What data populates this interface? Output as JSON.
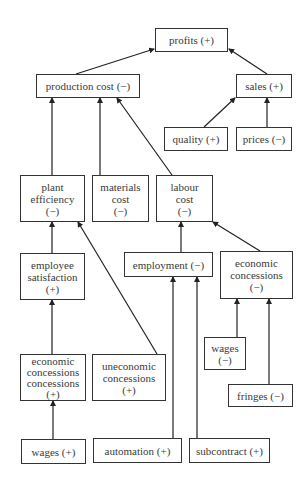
{
  "diagram": {
    "type": "causal-tree",
    "line_color": "#222222",
    "nodes": {
      "profits": {
        "lines": [
          "profits (+)"
        ]
      },
      "production_cost": {
        "lines": [
          "production cost (−)"
        ]
      },
      "sales": {
        "lines": [
          "sales (+)"
        ]
      },
      "quality": {
        "lines": [
          "quality (+)"
        ]
      },
      "prices": {
        "lines": [
          "prices (−)"
        ]
      },
      "plant_efficiency": {
        "lines": [
          "plant",
          "efficiency",
          "(−)"
        ]
      },
      "materials_cost": {
        "lines": [
          "materials",
          "cost",
          "(−)"
        ]
      },
      "labour_cost": {
        "lines": [
          "labour",
          "cost",
          "(−)"
        ]
      },
      "employee_satisfaction": {
        "lines": [
          "employee",
          "satisfaction",
          "(+)"
        ]
      },
      "employment": {
        "lines": [
          "employment (−)"
        ]
      },
      "economic_concessions_right": {
        "lines": [
          "economic",
          "concessions",
          "(−)"
        ]
      },
      "economic_concessions_left": {
        "lines": [
          "economic",
          "concessions",
          "concessions",
          "(+)"
        ]
      },
      "uneconomic_concessions": {
        "lines": [
          "uneconomic",
          "concessions",
          "(+)"
        ]
      },
      "wages_minus": {
        "lines": [
          "wages",
          "(−)"
        ]
      },
      "fringes": {
        "lines": [
          "fringes (−)"
        ]
      },
      "wages_plus": {
        "lines": [
          "wages (+)"
        ]
      },
      "automation": {
        "lines": [
          "automation (+)"
        ]
      },
      "subcontract": {
        "lines": [
          "subcontract (+)"
        ]
      }
    },
    "edges": [
      {
        "from": "production_cost",
        "to": "profits"
      },
      {
        "from": "sales",
        "to": "profits"
      },
      {
        "from": "quality",
        "to": "sales"
      },
      {
        "from": "prices",
        "to": "sales"
      },
      {
        "from": "plant_efficiency",
        "to": "production_cost"
      },
      {
        "from": "materials_cost",
        "to": "production_cost"
      },
      {
        "from": "labour_cost",
        "to": "production_cost"
      },
      {
        "from": "employee_satisfaction",
        "to": "plant_efficiency"
      },
      {
        "from": "uneconomic_concessions",
        "to": "plant_efficiency"
      },
      {
        "from": "employment",
        "to": "labour_cost"
      },
      {
        "from": "economic_concessions_right",
        "to": "labour_cost"
      },
      {
        "from": "economic_concessions_left",
        "to": "employee_satisfaction"
      },
      {
        "from": "wages_plus",
        "to": "economic_concessions_left"
      },
      {
        "from": "automation",
        "to": "employment"
      },
      {
        "from": "subcontract",
        "to": "employment"
      },
      {
        "from": "wages_minus",
        "to": "economic_concessions_right"
      },
      {
        "from": "fringes",
        "to": "economic_concessions_right"
      }
    ]
  }
}
